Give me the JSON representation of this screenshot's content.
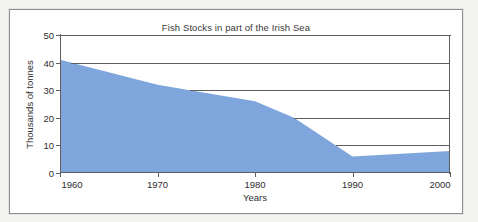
{
  "chart_data": {
    "type": "area",
    "title": "Fish Stocks in part of the Irish Sea",
    "xlabel": "Years",
    "ylabel": "Thousands of tonnes",
    "xlim": [
      1960,
      2000
    ],
    "ylim": [
      0,
      50
    ],
    "xticks": [
      1960,
      1970,
      1980,
      1990,
      2000
    ],
    "yticks": [
      0,
      10,
      20,
      30,
      40,
      50
    ],
    "xtick_labels": [
      "1960",
      "1970",
      "1980",
      "1990",
      "2000"
    ],
    "ytick_labels": [
      "0",
      "10",
      "20",
      "30",
      "40",
      "50"
    ],
    "grid": "horizontal-partial",
    "legend": null,
    "series": [
      {
        "name": "Fish stocks",
        "fill_color": "#7FA6DC",
        "x": [
          1960,
          1970,
          1980,
          1984,
          1990,
          2000
        ],
        "values": [
          41,
          32,
          26,
          20,
          6,
          8
        ]
      }
    ]
  },
  "colors": {
    "area_fill": "#7FA6DC",
    "axis": "#5E5E5E",
    "text": "#2E2E2E",
    "frame_border": "#8D8D8D",
    "page_background": "#F3F3F1",
    "plot_background": "#FFFFFF"
  }
}
